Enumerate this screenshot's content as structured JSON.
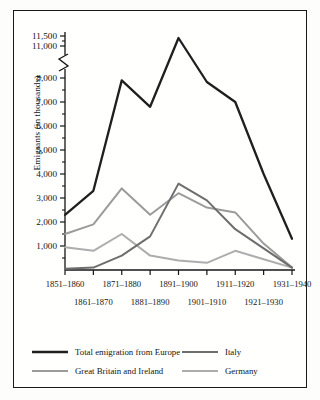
{
  "chart_data": {
    "type": "line",
    "title": "",
    "xlabel": "",
    "ylabel": "Emigrants (in thousands)",
    "grid": false,
    "legend_position": "bottom",
    "axis_break": {
      "present": true,
      "below": 8000,
      "above": 11000
    },
    "ylim": [
      0,
      11500
    ],
    "ytick_labels": [
      "11,500",
      "11,000",
      "8,000",
      "7,000",
      "6,000",
      "5,000",
      "4,000",
      "3,000",
      "2,000",
      "1,000"
    ],
    "ytick_values": [
      11500,
      11000,
      8000,
      7000,
      6000,
      5000,
      4000,
      3000,
      2000,
      1000
    ],
    "yminor_values": [
      11250,
      7500,
      6500,
      5500,
      4500,
      3500,
      2500,
      1500,
      500
    ],
    "categories": [
      "1851–1860",
      "1861–1870",
      "1871–1880",
      "1881–1890",
      "1891–1900",
      "1901–1910",
      "1911–1920",
      "1921–1930",
      "1931–1940"
    ],
    "categories_row_top": [
      "1851–1860",
      "1871–1880",
      "1891–1900",
      "1911–1920",
      "1931–1940"
    ],
    "categories_row_bottom": [
      "1861–1870",
      "1881–1890",
      "1901–1910",
      "1921–1930"
    ],
    "series": [
      {
        "name": "Total emigration from Europe",
        "color": "#1f1f1f",
        "width": 2.3,
        "values": [
          2300,
          3300,
          7900,
          6800,
          11400,
          9200,
          7000,
          4000,
          1300
        ]
      },
      {
        "name": "Great Britain and Ireland",
        "color": "#9b9b9b",
        "width": 2.0,
        "values": [
          1500,
          1900,
          3400,
          2300,
          3200,
          2600,
          2400,
          1100,
          100
        ]
      },
      {
        "name": "Italy",
        "color": "#6e6e6e",
        "width": 2.0,
        "values": [
          50,
          100,
          600,
          1400,
          3600,
          2900,
          1700,
          900,
          100
        ]
      },
      {
        "name": "Germany",
        "color": "#adadad",
        "width": 2.0,
        "values": [
          950,
          800,
          1500,
          600,
          400,
          300,
          800,
          450,
          100
        ]
      }
    ]
  },
  "legend": {
    "entries": [
      {
        "label": "Total emigration from Europe",
        "color": "#1f1f1f"
      },
      {
        "label": "Italy",
        "color": "#6e6e6e"
      },
      {
        "label": "Great Britain and Ireland",
        "color": "#9b9b9b"
      },
      {
        "label": "Germany",
        "color": "#adadad"
      }
    ]
  },
  "colors": {
    "frame": "#1a1a1a",
    "axis": "#141414",
    "background": "#fffffe"
  }
}
